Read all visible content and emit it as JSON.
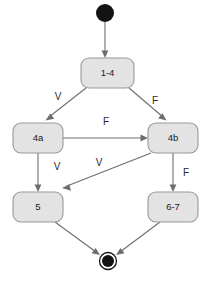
{
  "diagram": {
    "type": "state-transition-diagram",
    "colors": {
      "node_fill": "#e3e3e3",
      "node_stroke": "#9a9a9a",
      "edge_stroke": "#6e6e6e",
      "terminal_fill": "#131313",
      "background": "#ffffff"
    },
    "initial_node": {
      "name": "initial-state",
      "cx": 105,
      "cy": 13,
      "r": 9
    },
    "final_node": {
      "name": "final-state",
      "cx": 108,
      "cy": 261,
      "outer_r": 8.5,
      "inner_r": 6
    },
    "nodes": [
      {
        "id": "n1",
        "label": "1-4",
        "x": 81,
        "y": 58,
        "w": 53,
        "h": 30
      },
      {
        "id": "n2",
        "label": "4a",
        "x": 13,
        "y": 123,
        "w": 50,
        "h": 30
      },
      {
        "id": "n3",
        "label": "4b",
        "x": 148,
        "y": 123,
        "w": 50,
        "h": 30
      },
      {
        "id": "n4",
        "label": "5",
        "x": 13,
        "y": 192,
        "w": 50,
        "h": 30
      },
      {
        "id": "n5",
        "label": "6-7",
        "x": 148,
        "y": 192,
        "w": 50,
        "h": 30
      }
    ],
    "edges": [
      {
        "id": "e0",
        "from": "initial-state",
        "to": "n1",
        "label": "",
        "label_x": 0,
        "label_y": 0
      },
      {
        "id": "e1",
        "from": "n1",
        "to": "n2",
        "label": "V",
        "label_x": 58,
        "label_y": 97
      },
      {
        "id": "e2",
        "from": "n1",
        "to": "n3",
        "label": "F",
        "label_x": 155,
        "label_y": 101
      },
      {
        "id": "e3",
        "from": "n2",
        "to": "n3",
        "label": "F",
        "label_x": 106,
        "label_y": 122
      },
      {
        "id": "e4",
        "from": "n2",
        "to": "n4",
        "label": "V",
        "label_x": 57,
        "label_y": 167
      },
      {
        "id": "e5",
        "from": "n3",
        "to": "n4",
        "label": "V",
        "label_x": 99,
        "label_y": 163
      },
      {
        "id": "e6",
        "from": "n3",
        "to": "n5",
        "label": "F",
        "label_x": 186,
        "label_y": 173
      },
      {
        "id": "e7",
        "from": "n4",
        "to": "final-state",
        "label": "",
        "label_x": 0,
        "label_y": 0
      },
      {
        "id": "e8",
        "from": "n5",
        "to": "final-state",
        "label": "",
        "label_x": 0,
        "label_y": 0
      }
    ]
  }
}
